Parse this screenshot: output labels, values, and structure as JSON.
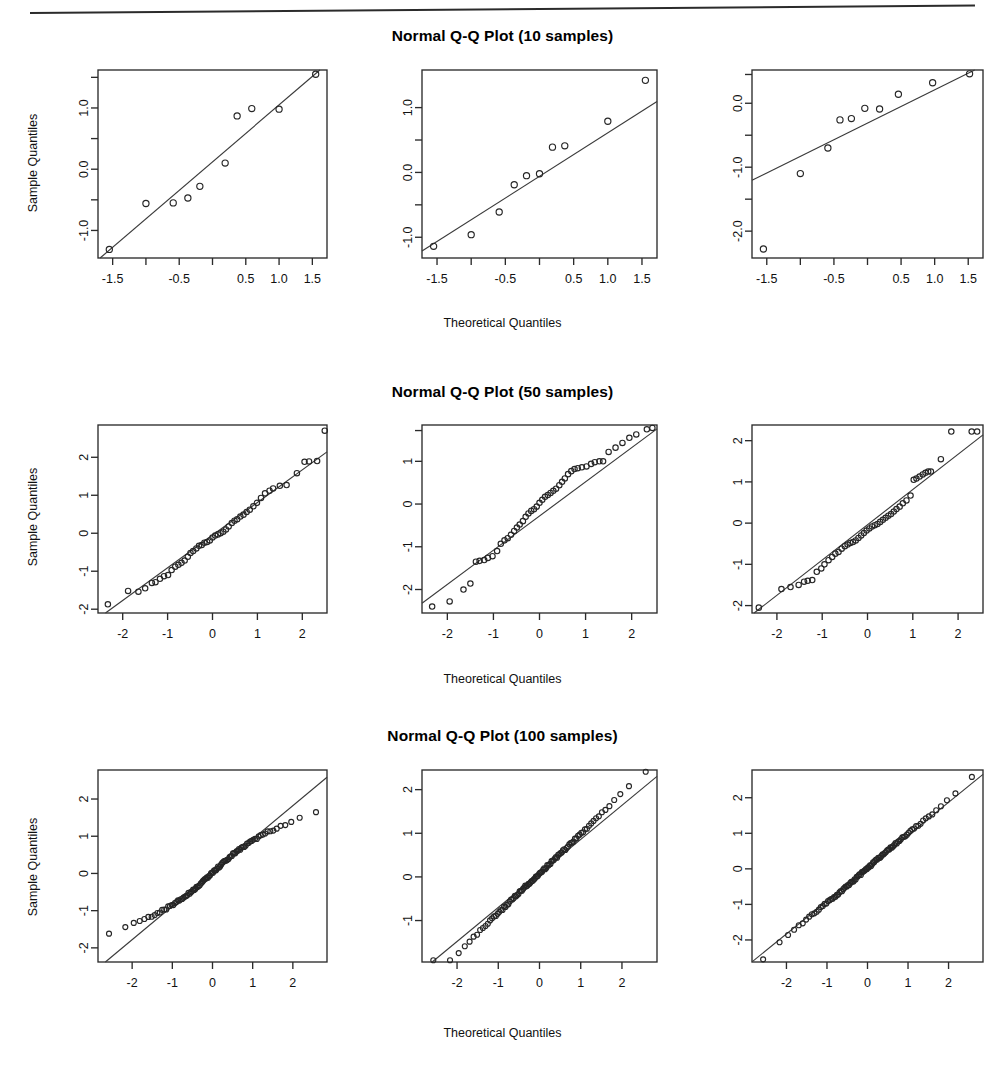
{
  "figure": {
    "xlabel": "Theoretical Quantiles",
    "ylabel": "Sample Quantiles",
    "rows": [
      {
        "title": "Normal Q-Q Plot (10 samples)"
      },
      {
        "title": "Normal Q-Q Plot (50 samples)"
      },
      {
        "title": "Normal Q-Q Plot (100 samples)"
      }
    ]
  },
  "chart_data": [
    {
      "type": "scatter",
      "title": "Normal Q-Q Plot (10 samples)",
      "panel": 1,
      "xlabel": "Theoretical Quantiles",
      "ylabel": "Sample Quantiles",
      "grid": false,
      "legend": null,
      "xlim": [
        -1.72,
        1.72
      ],
      "ylim": [
        -1.45,
        1.62
      ],
      "xticks": [
        -1.5,
        -0.5,
        0.5,
        1.0,
        1.5
      ],
      "xticklabels": [
        "-1.5",
        "-0.5",
        "0.5",
        "1.0",
        "1.5"
      ],
      "xminorticks": [
        -1.0,
        0.0
      ],
      "yticks": [
        -1.0,
        0.0,
        1.0
      ],
      "yticklabels": [
        "-1.0",
        "0.0",
        "1.0"
      ],
      "yminorticks": [
        -0.5,
        0.5,
        1.5
      ],
      "x": [
        -1.55,
        -1.0,
        -0.59,
        -0.37,
        -0.19,
        0.0,
        0.19,
        0.37,
        0.59,
        1.0,
        1.55
      ],
      "points": [
        [
          -1.55,
          -1.31
        ],
        [
          -1.0,
          -0.56
        ],
        [
          -0.59,
          -0.55
        ],
        [
          -0.37,
          -0.47
        ],
        [
          -0.19,
          -0.28
        ],
        [
          0.19,
          0.1
        ],
        [
          0.37,
          0.87
        ],
        [
          0.59,
          0.99
        ],
        [
          1.0,
          0.98
        ],
        [
          1.55,
          1.55
        ]
      ],
      "refline": {
        "slope": 0.93,
        "intercept": 0.12
      }
    },
    {
      "type": "scatter",
      "title": "Normal Q-Q Plot (10 samples)",
      "panel": 2,
      "xlabel": "Theoretical Quantiles",
      "ylabel": "",
      "grid": false,
      "legend": null,
      "xlim": [
        -1.72,
        1.72
      ],
      "ylim": [
        -1.32,
        1.58
      ],
      "xticks": [
        -1.5,
        -0.5,
        0.5,
        1.0,
        1.5
      ],
      "xticklabels": [
        "-1.5",
        "-0.5",
        "0.5",
        "1.0",
        "1.5"
      ],
      "xminorticks": [
        -1.0,
        0.0
      ],
      "yticks": [
        -1.0,
        0.0,
        1.0
      ],
      "yticklabels": [
        "-1.0",
        "0.0",
        "1.0"
      ],
      "yminorticks": [
        -0.5,
        0.5
      ],
      "points": [
        [
          -1.55,
          -1.14
        ],
        [
          -1.0,
          -0.96
        ],
        [
          -0.59,
          -0.61
        ],
        [
          -0.37,
          -0.19
        ],
        [
          -0.19,
          -0.05
        ],
        [
          0.0,
          -0.02
        ],
        [
          0.19,
          0.39
        ],
        [
          0.37,
          0.41
        ],
        [
          1.0,
          0.79
        ],
        [
          1.55,
          1.42
        ]
      ],
      "refline": {
        "slope": 0.67,
        "intercept": -0.06
      }
    },
    {
      "type": "scatter",
      "title": "Normal Q-Q Plot (10 samples)",
      "panel": 3,
      "xlabel": "Theoretical Quantiles",
      "ylabel": "",
      "grid": false,
      "legend": null,
      "xlim": [
        -1.72,
        1.72
      ],
      "ylim": [
        -2.42,
        0.52
      ],
      "xticks": [
        -1.5,
        -0.5,
        0.5,
        1.0,
        1.5
      ],
      "xticklabels": [
        "-1.5",
        "-0.5",
        "0.5",
        "1.0",
        "1.5"
      ],
      "xminorticks": [
        -1.0,
        0.0
      ],
      "yticks": [
        -2.0,
        -1.0,
        0.0
      ],
      "yticklabels": [
        "-2.0",
        "-1.0",
        "0.0"
      ],
      "yminorticks": [
        -1.5,
        -0.5,
        0.45
      ],
      "points": [
        [
          -1.55,
          -2.28
        ],
        [
          -1.0,
          -1.1
        ],
        [
          -0.59,
          -0.7
        ],
        [
          -0.41,
          -0.26
        ],
        [
          -0.24,
          -0.24
        ],
        [
          -0.04,
          -0.08
        ],
        [
          0.18,
          -0.09
        ],
        [
          0.46,
          0.14
        ],
        [
          0.97,
          0.32
        ],
        [
          1.52,
          0.46
        ]
      ],
      "refline": {
        "slope": 0.52,
        "intercept": -0.31
      }
    },
    {
      "type": "scatter",
      "title": "Normal Q-Q Plot (50 samples)",
      "panel": 4,
      "xlabel": "Theoretical Quantiles",
      "ylabel": "Sample Quantiles",
      "grid": false,
      "legend": null,
      "xlim": [
        -2.55,
        2.55
      ],
      "ylim": [
        -2.1,
        2.85
      ],
      "xticks": [
        -2,
        -1,
        0,
        1,
        2
      ],
      "xticklabels": [
        "-2",
        "-1",
        "0",
        "1",
        "2"
      ],
      "yticks": [
        -2,
        -1,
        0,
        1,
        2
      ],
      "yticklabels": [
        "-2",
        "-1",
        "0",
        "1",
        "2"
      ],
      "points": [
        [
          -2.33,
          -1.87
        ],
        [
          -1.88,
          -1.52
        ],
        [
          -1.65,
          -1.54
        ],
        [
          -1.5,
          -1.45
        ],
        [
          -1.35,
          -1.31
        ],
        [
          -1.27,
          -1.29
        ],
        [
          -1.17,
          -1.2
        ],
        [
          -1.08,
          -1.13
        ],
        [
          -0.99,
          -1.1
        ],
        [
          -0.91,
          -0.97
        ],
        [
          -0.83,
          -0.88
        ],
        [
          -0.76,
          -0.83
        ],
        [
          -0.69,
          -0.78
        ],
        [
          -0.62,
          -0.72
        ],
        [
          -0.55,
          -0.62
        ],
        [
          -0.49,
          -0.52
        ],
        [
          -0.43,
          -0.47
        ],
        [
          -0.36,
          -0.4
        ],
        [
          -0.3,
          -0.33
        ],
        [
          -0.24,
          -0.31
        ],
        [
          -0.18,
          -0.25
        ],
        [
          -0.12,
          -0.23
        ],
        [
          -0.06,
          -0.19
        ],
        [
          0.0,
          -0.11
        ],
        [
          0.06,
          -0.06
        ],
        [
          0.12,
          -0.03
        ],
        [
          0.18,
          0.0
        ],
        [
          0.24,
          0.04
        ],
        [
          0.3,
          0.1
        ],
        [
          0.36,
          0.18
        ],
        [
          0.43,
          0.27
        ],
        [
          0.49,
          0.33
        ],
        [
          0.55,
          0.37
        ],
        [
          0.62,
          0.44
        ],
        [
          0.69,
          0.49
        ],
        [
          0.76,
          0.56
        ],
        [
          0.83,
          0.62
        ],
        [
          0.91,
          0.71
        ],
        [
          0.99,
          0.8
        ],
        [
          1.08,
          0.93
        ],
        [
          1.17,
          1.05
        ],
        [
          1.27,
          1.12
        ],
        [
          1.35,
          1.18
        ],
        [
          1.5,
          1.25
        ],
        [
          1.65,
          1.27
        ],
        [
          1.88,
          1.58
        ],
        [
          2.05,
          1.88
        ],
        [
          2.15,
          1.89
        ],
        [
          2.33,
          1.9
        ],
        [
          2.5,
          2.7
        ]
      ],
      "refline": {
        "slope": 0.86,
        "intercept": -0.05
      }
    },
    {
      "type": "scatter",
      "title": "Normal Q-Q Plot (50 samples)",
      "panel": 5,
      "xlabel": "Theoretical Quantiles",
      "ylabel": "",
      "grid": false,
      "legend": null,
      "xlim": [
        -2.55,
        2.55
      ],
      "ylim": [
        -2.55,
        1.85
      ],
      "xticks": [
        -2,
        -1,
        0,
        1,
        2
      ],
      "xticklabels": [
        "-2",
        "-1",
        "0",
        "1",
        "2"
      ],
      "yticks": [
        -2,
        -1,
        0,
        1
      ],
      "yticklabels": [
        "-2",
        "-1",
        "0",
        "1"
      ],
      "yminorticks": [
        1.72
      ],
      "points": [
        [
          -2.33,
          -2.4
        ],
        [
          -1.95,
          -2.28
        ],
        [
          -1.65,
          -2.0
        ],
        [
          -1.5,
          -1.86
        ],
        [
          -1.38,
          -1.35
        ],
        [
          -1.3,
          -1.33
        ],
        [
          -1.2,
          -1.31
        ],
        [
          -1.12,
          -1.26
        ],
        [
          -1.02,
          -1.22
        ],
        [
          -0.92,
          -1.1
        ],
        [
          -0.84,
          -0.93
        ],
        [
          -0.76,
          -0.85
        ],
        [
          -0.69,
          -0.8
        ],
        [
          -0.62,
          -0.72
        ],
        [
          -0.55,
          -0.63
        ],
        [
          -0.49,
          -0.55
        ],
        [
          -0.43,
          -0.48
        ],
        [
          -0.36,
          -0.4
        ],
        [
          -0.3,
          -0.3
        ],
        [
          -0.24,
          -0.22
        ],
        [
          -0.18,
          -0.16
        ],
        [
          -0.12,
          -0.12
        ],
        [
          -0.06,
          -0.06
        ],
        [
          0.0,
          0.03
        ],
        [
          0.06,
          0.1
        ],
        [
          0.12,
          0.17
        ],
        [
          0.18,
          0.21
        ],
        [
          0.24,
          0.26
        ],
        [
          0.3,
          0.31
        ],
        [
          0.36,
          0.36
        ],
        [
          0.43,
          0.44
        ],
        [
          0.49,
          0.52
        ],
        [
          0.55,
          0.6
        ],
        [
          0.62,
          0.7
        ],
        [
          0.69,
          0.77
        ],
        [
          0.76,
          0.82
        ],
        [
          0.83,
          0.84
        ],
        [
          0.92,
          0.86
        ],
        [
          1.02,
          0.88
        ],
        [
          1.12,
          0.94
        ],
        [
          1.2,
          0.98
        ],
        [
          1.3,
          1.0
        ],
        [
          1.38,
          1.0
        ],
        [
          1.5,
          1.22
        ],
        [
          1.65,
          1.32
        ],
        [
          1.8,
          1.43
        ],
        [
          1.95,
          1.55
        ],
        [
          2.1,
          1.63
        ],
        [
          2.33,
          1.75
        ],
        [
          2.45,
          1.78
        ]
      ],
      "refline": {
        "slope": 0.8,
        "intercept": -0.28
      }
    },
    {
      "type": "scatter",
      "title": "Normal Q-Q Plot (50 samples)",
      "panel": 6,
      "xlabel": "Theoretical Quantiles",
      "ylabel": "",
      "grid": false,
      "legend": null,
      "xlim": [
        -2.55,
        2.55
      ],
      "ylim": [
        -2.18,
        2.38
      ],
      "xticks": [
        -2,
        -1,
        0,
        1,
        2
      ],
      "xticklabels": [
        "-2",
        "-1",
        "0",
        "1",
        "2"
      ],
      "yticks": [
        -2,
        -1,
        0,
        1,
        2
      ],
      "yticklabels": [
        "-2",
        "-1",
        "0",
        "1",
        "2"
      ],
      "points": [
        [
          -2.4,
          -2.05
        ],
        [
          -1.9,
          -1.6
        ],
        [
          -1.7,
          -1.55
        ],
        [
          -1.52,
          -1.5
        ],
        [
          -1.4,
          -1.42
        ],
        [
          -1.32,
          -1.4
        ],
        [
          -1.22,
          -1.38
        ],
        [
          -1.12,
          -1.18
        ],
        [
          -1.02,
          -1.1
        ],
        [
          -0.95,
          -1.0
        ],
        [
          -0.86,
          -0.9
        ],
        [
          -0.78,
          -0.82
        ],
        [
          -0.71,
          -0.74
        ],
        [
          -0.64,
          -0.7
        ],
        [
          -0.57,
          -0.62
        ],
        [
          -0.5,
          -0.56
        ],
        [
          -0.44,
          -0.52
        ],
        [
          -0.38,
          -0.48
        ],
        [
          -0.32,
          -0.46
        ],
        [
          -0.26,
          -0.42
        ],
        [
          -0.2,
          -0.36
        ],
        [
          -0.14,
          -0.3
        ],
        [
          -0.08,
          -0.24
        ],
        [
          -0.02,
          -0.18
        ],
        [
          0.04,
          -0.13
        ],
        [
          0.1,
          -0.08
        ],
        [
          0.16,
          -0.05
        ],
        [
          0.22,
          -0.02
        ],
        [
          0.28,
          0.03
        ],
        [
          0.34,
          0.08
        ],
        [
          0.4,
          0.13
        ],
        [
          0.46,
          0.18
        ],
        [
          0.52,
          0.22
        ],
        [
          0.58,
          0.28
        ],
        [
          0.64,
          0.34
        ],
        [
          0.71,
          0.4
        ],
        [
          0.78,
          0.48
        ],
        [
          0.86,
          0.55
        ],
        [
          0.95,
          0.67
        ],
        [
          1.02,
          1.05
        ],
        [
          1.08,
          1.08
        ],
        [
          1.15,
          1.13
        ],
        [
          1.22,
          1.18
        ],
        [
          1.28,
          1.22
        ],
        [
          1.34,
          1.25
        ],
        [
          1.4,
          1.25
        ],
        [
          1.62,
          1.55
        ],
        [
          1.85,
          2.22
        ],
        [
          2.3,
          2.22
        ],
        [
          2.42,
          2.22
        ]
      ],
      "refline": {
        "slope": 0.855,
        "intercept": -0.04
      }
    },
    {
      "type": "scatter",
      "title": "Normal Q-Q Plot (100 samples)",
      "panel": 7,
      "xlabel": "Theoretical Quantiles",
      "ylabel": "Sample Quantiles",
      "grid": false,
      "legend": null,
      "xlim": [
        -2.85,
        2.85
      ],
      "ylim": [
        -2.38,
        2.78
      ],
      "xticks": [
        -2,
        -1,
        0,
        1,
        2
      ],
      "xticklabels": [
        "-2",
        "-1",
        "0",
        "1",
        "2"
      ],
      "yticks": [
        -2,
        -1,
        0,
        1,
        2
      ],
      "yticklabels": [
        "-2",
        "-1",
        "0",
        "1",
        "2"
      ],
      "n": 100,
      "refline": {
        "slope": 0.9,
        "intercept": 0.02
      },
      "pattern": "S-shaped with heavy lower tail; lowest points near (-2.6,-2.12) and flattening upper tail near (2.1,2.08); max point (2.6,2.62)"
    },
    {
      "type": "scatter",
      "title": "Normal Q-Q Plot (100 samples)",
      "panel": 8,
      "xlabel": "Theoretical Quantiles",
      "ylabel": "",
      "grid": false,
      "legend": null,
      "xlim": [
        -2.85,
        2.85
      ],
      "ylim": [
        -1.95,
        2.45
      ],
      "xticks": [
        -2,
        -1,
        0,
        1,
        2
      ],
      "xticklabels": [
        "-2",
        "-1",
        "0",
        "1",
        "2"
      ],
      "yticks": [
        -1,
        0,
        1,
        2
      ],
      "yticklabels": [
        "-1",
        "0",
        "1",
        "2"
      ],
      "n": 100,
      "refline": {
        "slope": 0.78,
        "intercept": 0.08
      },
      "pattern": "Tight along reference line; short lower tail flattening near y=-1.7, upper tail reaching (2.6,2.35)"
    },
    {
      "type": "scatter",
      "title": "Normal Q-Q Plot (100 samples)",
      "panel": 9,
      "xlabel": "Theoretical Quantiles",
      "ylabel": "",
      "grid": false,
      "legend": null,
      "xlim": [
        -2.85,
        2.85
      ],
      "ylim": [
        -2.62,
        2.78
      ],
      "xticks": [
        -2,
        -1,
        0,
        1,
        2
      ],
      "xticklabels": [
        "-2",
        "-1",
        "0",
        "1",
        "2"
      ],
      "yticks": [
        -2,
        -1,
        0,
        1,
        2
      ],
      "yticklabels": [
        "-2",
        "-1",
        "0",
        "1",
        "2"
      ],
      "n": 100,
      "refline": {
        "slope": 0.925,
        "intercept": 0.02
      },
      "pattern": "Very close to reference line across the full range; slight upward deviation in upper tail, max point (2.6,2.70)"
    }
  ]
}
